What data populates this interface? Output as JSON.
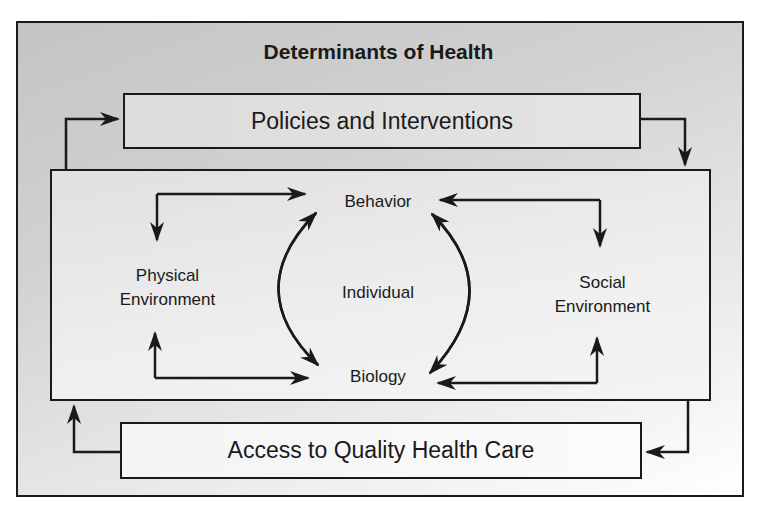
{
  "title": "Determinants of Health",
  "boxes": {
    "policies": "Policies and Interventions",
    "access": "Access to Quality Health Care"
  },
  "nodes": {
    "behavior": "Behavior",
    "biology": "Biology",
    "individual": "Individual",
    "physical_line1": "Physical",
    "physical_line2": "Environment",
    "social_line1": "Social",
    "social_line2": "Environment"
  },
  "colors": {
    "line": "#1a1a1a",
    "bg_dark": "#c4c4c4",
    "bg_light": "#ffffff"
  }
}
